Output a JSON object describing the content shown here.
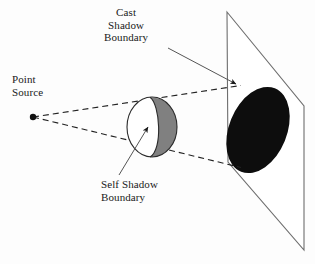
{
  "figure": {
    "title_present": false,
    "background_color": "#ffffff",
    "labels": {
      "cast_shadow_boundary": {
        "name": "cast-shadow-boundary-label",
        "lines": [
          "Cast",
          "Shadow",
          "Boundary"
        ],
        "text": "Cast\nShadow\nBoundary",
        "align": "center"
      },
      "point_source": {
        "name": "point-source-label",
        "lines": [
          "Point",
          "Source"
        ],
        "text": "Point\nSource",
        "align": "left"
      },
      "self_shadow_boundary": {
        "name": "self-shadow-boundary-label",
        "lines": [
          "Self Shadow",
          "Boundary"
        ],
        "text": "Self Shadow\nBoundary",
        "align": "left"
      }
    },
    "elements": {
      "point_source_dot": {
        "name": "point-source-dot",
        "cx": 33,
        "cy": 117,
        "r": 3.2,
        "color": "#111111"
      },
      "sphere": {
        "name": "sphere-object",
        "cx": 152,
        "cy": 127,
        "rx": 25,
        "ry": 30,
        "outline_color": "#2b2b2b",
        "lit_color": "#ffffff",
        "shadow_color": "#808080"
      },
      "self_shadow_terminator": {
        "name": "self-shadow-terminator-arc",
        "color": "#2b2b2b"
      },
      "plane": {
        "name": "receiving-plane",
        "corners": [
          [
            227,
            12
          ],
          [
            304,
            106
          ],
          [
            304,
            250
          ],
          [
            228,
            162
          ]
        ],
        "stroke_color": "#6e6e6e"
      },
      "cast_shadow_ellipse": {
        "name": "cast-shadow-ellipse",
        "cx": 258,
        "cy": 130,
        "rx": 29,
        "ry": 45,
        "rotation_deg": 22,
        "fill_color": "#0d0d0d"
      },
      "light_ray_upper": {
        "name": "light-ray-upper-dashed",
        "from": [
          33,
          117
        ],
        "to": [
          240,
          86
        ],
        "style": "dashed",
        "color": "#222222"
      },
      "light_ray_lower": {
        "name": "light-ray-lower-dashed",
        "from": [
          33,
          117
        ],
        "to": [
          240,
          167
        ],
        "style": "dashed",
        "color": "#222222"
      },
      "leader_cast": {
        "name": "cast-shadow-leader-line",
        "from": [
          168,
          48
        ],
        "to": [
          239,
          86
        ],
        "arrow": true,
        "color": "#555555"
      },
      "leader_self": {
        "name": "self-shadow-leader-line",
        "from": [
          119,
          175
        ],
        "to": [
          150,
          126
        ],
        "arrow": true,
        "color": "#555555"
      }
    }
  }
}
